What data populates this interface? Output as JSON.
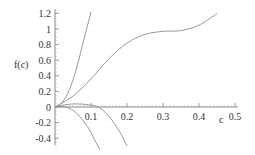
{
  "chart_data": {
    "type": "line",
    "title": "",
    "xlabel": "c",
    "ylabel": "f(c)",
    "xlim": [
      0,
      0.5
    ],
    "ylim": [
      -0.55,
      1.25
    ],
    "grid": false,
    "legend": null,
    "x_ticks": [
      "0.1",
      "0.2",
      "0.3",
      "0.4",
      "0.5"
    ],
    "y_ticks": [
      "1.2",
      "1",
      "0.8",
      "0.6",
      "0.4",
      "0.2",
      "0",
      "-0.2",
      "-0.4"
    ],
    "series": [
      {
        "name": "curve-steep-rise",
        "x": [
          0,
          0.02,
          0.04,
          0.06,
          0.08,
          0.1
        ],
        "y": [
          0,
          0.06,
          0.22,
          0.5,
          0.86,
          1.22
        ]
      },
      {
        "name": "curve-s-shape",
        "x": [
          0,
          0.05,
          0.1,
          0.15,
          0.2,
          0.25,
          0.3,
          0.35,
          0.4,
          0.45
        ],
        "y": [
          0,
          0.14,
          0.36,
          0.62,
          0.82,
          0.93,
          0.97,
          0.98,
          1.05,
          1.2
        ]
      },
      {
        "name": "curve-hump",
        "x": [
          0,
          0.03,
          0.06,
          0.09,
          0.12,
          0.15,
          0.18,
          0.2
        ],
        "y": [
          0,
          0.03,
          0.04,
          0.03,
          0.0,
          -0.12,
          -0.32,
          -0.5
        ]
      },
      {
        "name": "curve-steep-fall",
        "x": [
          0,
          0.03,
          0.06,
          0.09,
          0.11,
          0.125
        ],
        "y": [
          0,
          0.0,
          -0.08,
          -0.25,
          -0.42,
          -0.55
        ]
      }
    ]
  }
}
